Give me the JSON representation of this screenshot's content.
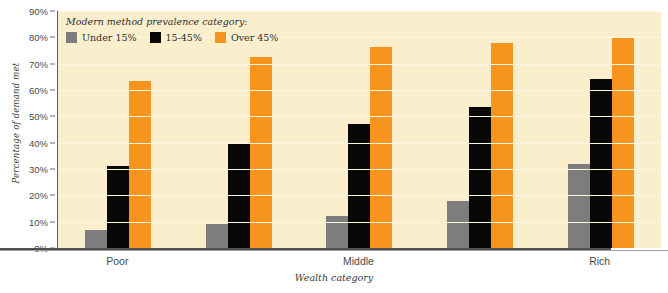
{
  "chart_data": {
    "type": "bar",
    "title": "",
    "xlabel": "Wealth category",
    "ylabel": "Percentage of demand met",
    "categories": [
      "Poor",
      "",
      "Middle",
      "",
      "Rich"
    ],
    "ylim": [
      0,
      90
    ],
    "ytick_labels": [
      "90%",
      "80%",
      "70%",
      "60%",
      "50%",
      "40%",
      "30%",
      "20%",
      "10%",
      "0%"
    ],
    "ytick_values": [
      90,
      80,
      70,
      60,
      50,
      40,
      30,
      20,
      10,
      0
    ],
    "grid": true,
    "legend_position": "top-left",
    "legend_title": "Modern method prevalence category:",
    "series": [
      {
        "name": "Under 15%",
        "color": "#7d7d7d",
        "values": [
          7,
          9,
          12,
          18,
          32
        ]
      },
      {
        "name": "15-45%",
        "color": "#080808",
        "values": [
          31,
          39.5,
          47,
          53.5,
          64
        ]
      },
      {
        "name": "Over 45%",
        "color": "#f7941d",
        "values": [
          63.5,
          72.5,
          76.5,
          78,
          80
        ]
      }
    ]
  },
  "colors": {
    "plot_background": "#fbeecd",
    "gridline": "#fdf7e4",
    "axis": "#4f4f4f",
    "page_background": "#ffffff"
  }
}
